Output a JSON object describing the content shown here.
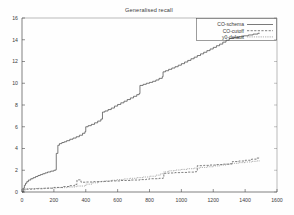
{
  "chart_data": {
    "type": "line",
    "title": "Generalised recall",
    "xlabel": "",
    "ylabel": "",
    "xlim": [
      0,
      1600
    ],
    "ylim": [
      0,
      16
    ],
    "xticks": [
      0,
      200,
      400,
      600,
      800,
      1000,
      1200,
      1400,
      1600
    ],
    "yticks": [
      0,
      2,
      4,
      6,
      8,
      10,
      12,
      14,
      16
    ],
    "grid": false,
    "legend_position": "top-right",
    "series": [
      {
        "name": "CO-schema",
        "style": "solid",
        "color": "#4d4d4d",
        "points": [
          [
            0,
            0.0
          ],
          [
            8,
            0.35
          ],
          [
            15,
            0.62
          ],
          [
            22,
            0.8
          ],
          [
            30,
            0.95
          ],
          [
            40,
            1.1
          ],
          [
            55,
            1.22
          ],
          [
            70,
            1.32
          ],
          [
            85,
            1.42
          ],
          [
            100,
            1.52
          ],
          [
            115,
            1.6
          ],
          [
            130,
            1.68
          ],
          [
            145,
            1.76
          ],
          [
            160,
            1.84
          ],
          [
            180,
            1.92
          ],
          [
            200,
            2.0
          ],
          [
            212,
            2.05
          ],
          [
            215,
            3.55
          ],
          [
            225,
            4.3
          ],
          [
            235,
            4.45
          ],
          [
            250,
            4.55
          ],
          [
            265,
            4.62
          ],
          [
            280,
            4.72
          ],
          [
            300,
            4.85
          ],
          [
            320,
            4.96
          ],
          [
            340,
            5.08
          ],
          [
            360,
            5.22
          ],
          [
            380,
            5.4
          ],
          [
            395,
            5.55
          ],
          [
            400,
            6.0
          ],
          [
            415,
            6.1
          ],
          [
            435,
            6.22
          ],
          [
            455,
            6.36
          ],
          [
            475,
            6.52
          ],
          [
            495,
            6.7
          ],
          [
            505,
            7.35
          ],
          [
            520,
            7.45
          ],
          [
            540,
            7.58
          ],
          [
            560,
            7.72
          ],
          [
            580,
            7.9
          ],
          [
            600,
            8.05
          ],
          [
            620,
            8.2
          ],
          [
            640,
            8.35
          ],
          [
            660,
            8.5
          ],
          [
            680,
            8.65
          ],
          [
            700,
            8.8
          ],
          [
            720,
            8.95
          ],
          [
            735,
            9.05
          ],
          [
            740,
            9.8
          ],
          [
            760,
            9.9
          ],
          [
            780,
            10.0
          ],
          [
            800,
            10.08
          ],
          [
            820,
            10.18
          ],
          [
            840,
            10.3
          ],
          [
            860,
            10.45
          ],
          [
            880,
            10.6
          ],
          [
            885,
            11.05
          ],
          [
            900,
            11.15
          ],
          [
            920,
            11.28
          ],
          [
            940,
            11.4
          ],
          [
            960,
            11.52
          ],
          [
            980,
            11.66
          ],
          [
            1000,
            11.8
          ],
          [
            1020,
            11.95
          ],
          [
            1040,
            12.1
          ],
          [
            1060,
            12.25
          ],
          [
            1080,
            12.4
          ],
          [
            1100,
            12.55
          ],
          [
            1120,
            12.7
          ],
          [
            1140,
            12.85
          ],
          [
            1160,
            13.0
          ],
          [
            1180,
            13.15
          ],
          [
            1200,
            13.3
          ],
          [
            1220,
            13.45
          ],
          [
            1240,
            13.6
          ],
          [
            1260,
            13.78
          ],
          [
            1280,
            13.95
          ],
          [
            1300,
            14.12
          ],
          [
            1330,
            14.2
          ],
          [
            1360,
            14.28
          ],
          [
            1390,
            14.36
          ],
          [
            1420,
            14.44
          ],
          [
            1450,
            14.52
          ],
          [
            1480,
            14.6
          ],
          [
            1490,
            14.62
          ]
        ]
      },
      {
        "name": "CO-cutoff",
        "style": "dashed",
        "color": "#555555",
        "points": [
          [
            0,
            0.0
          ],
          [
            10,
            0.2
          ],
          [
            30,
            0.26
          ],
          [
            80,
            0.3
          ],
          [
            140,
            0.35
          ],
          [
            200,
            0.42
          ],
          [
            260,
            0.5
          ],
          [
            300,
            0.58
          ],
          [
            330,
            0.7
          ],
          [
            345,
            1.12
          ],
          [
            360,
            1.12
          ],
          [
            370,
            0.9
          ],
          [
            400,
            0.92
          ],
          [
            450,
            0.95
          ],
          [
            500,
            0.98
          ],
          [
            560,
            1.02
          ],
          [
            620,
            1.06
          ],
          [
            680,
            1.1
          ],
          [
            740,
            1.14
          ],
          [
            780,
            1.18
          ],
          [
            800,
            1.22
          ],
          [
            860,
            1.26
          ],
          [
            885,
            1.3
          ],
          [
            890,
            1.72
          ],
          [
            920,
            1.75
          ],
          [
            960,
            1.78
          ],
          [
            1000,
            1.8
          ],
          [
            1040,
            1.83
          ],
          [
            1080,
            1.86
          ],
          [
            1095,
            1.88
          ],
          [
            1100,
            2.42
          ],
          [
            1140,
            2.45
          ],
          [
            1180,
            2.48
          ],
          [
            1220,
            2.52
          ],
          [
            1260,
            2.56
          ],
          [
            1300,
            2.6
          ],
          [
            1320,
            2.8
          ],
          [
            1360,
            2.85
          ],
          [
            1400,
            2.92
          ],
          [
            1440,
            3.02
          ],
          [
            1470,
            3.12
          ],
          [
            1490,
            3.22
          ]
        ]
      },
      {
        "name": "y0-default",
        "style": "dotted",
        "color": "#6a6a6a",
        "points": [
          [
            0,
            0.3
          ],
          [
            40,
            0.32
          ],
          [
            100,
            0.34
          ],
          [
            160,
            0.36
          ],
          [
            220,
            0.4
          ],
          [
            280,
            0.46
          ],
          [
            340,
            0.55
          ],
          [
            400,
            0.72
          ],
          [
            440,
            0.85
          ],
          [
            480,
            0.95
          ],
          [
            520,
            1.02
          ],
          [
            560,
            1.08
          ],
          [
            600,
            1.14
          ],
          [
            640,
            1.2
          ],
          [
            680,
            1.26
          ],
          [
            720,
            1.32
          ],
          [
            760,
            1.38
          ],
          [
            800,
            1.45
          ],
          [
            840,
            1.55
          ],
          [
            870,
            1.68
          ],
          [
            890,
            1.85
          ],
          [
            920,
            1.95
          ],
          [
            960,
            2.02
          ],
          [
            1000,
            2.08
          ],
          [
            1040,
            2.14
          ],
          [
            1080,
            2.2
          ],
          [
            1120,
            2.26
          ],
          [
            1160,
            2.32
          ],
          [
            1200,
            2.4
          ],
          [
            1240,
            2.48
          ],
          [
            1280,
            2.56
          ],
          [
            1320,
            2.64
          ],
          [
            1360,
            2.7
          ],
          [
            1400,
            2.76
          ],
          [
            1440,
            2.82
          ],
          [
            1470,
            2.86
          ],
          [
            1490,
            2.9
          ]
        ]
      }
    ]
  }
}
